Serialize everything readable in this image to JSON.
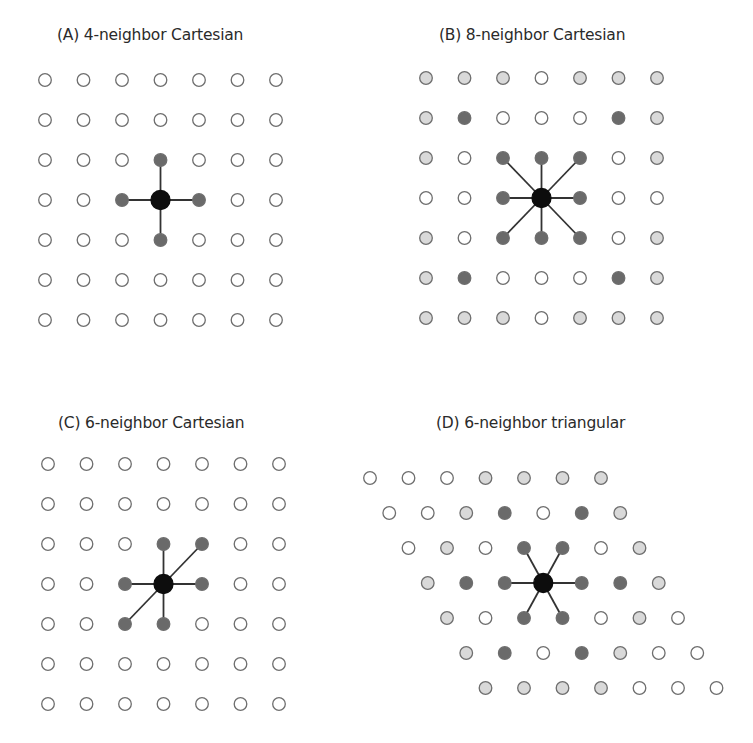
{
  "colors": {
    "empty_fill": "#ffffff",
    "light_fill": "#d9d9d9",
    "dark_fill": "#6a6a6a",
    "center_fill": "#0d0d0d",
    "stroke": "#6e6e6e",
    "edge": "#333333",
    "title_text": "#2a2a2a"
  },
  "panels": [
    {
      "id": "A",
      "title": "(A) 4-neighbor Cartesian",
      "title_pos": [
        57,
        26
      ],
      "origin": [
        45,
        80
      ],
      "dx": 38.5,
      "dy": 40,
      "row_shift": 0,
      "grid": [
        "0000000",
        "0000000",
        "000D000",
        "00DCD00",
        "000D000",
        "0000000",
        "0000000"
      ],
      "center": [
        3,
        3
      ],
      "edges": [
        [
          2,
          3
        ],
        [
          3,
          2
        ],
        [
          3,
          4
        ],
        [
          4,
          3
        ]
      ]
    },
    {
      "id": "B",
      "title": "(B) 8-neighbor Cartesian",
      "title_pos": [
        439,
        26
      ],
      "origin": [
        426,
        78
      ],
      "dx": 38.5,
      "dy": 40,
      "row_shift": 0,
      "grid": [
        "LLL0LLL",
        "LD000DL",
        "L0DDD0L",
        "00DCD00",
        "L0DDD0L",
        "LD000DL",
        "LLL0LLL"
      ],
      "center": [
        3,
        3
      ],
      "edges": [
        [
          2,
          2
        ],
        [
          2,
          3
        ],
        [
          2,
          4
        ],
        [
          3,
          2
        ],
        [
          3,
          4
        ],
        [
          4,
          2
        ],
        [
          4,
          3
        ],
        [
          4,
          4
        ]
      ]
    },
    {
      "id": "C",
      "title": "(C) 6-neighbor Cartesian",
      "title_pos": [
        58,
        414
      ],
      "origin": [
        48,
        464
      ],
      "dx": 38.5,
      "dy": 40,
      "row_shift": 0,
      "grid": [
        "0000000",
        "0000000",
        "000DD00",
        "00DCD00",
        "00DD000",
        "0000000",
        "0000000"
      ],
      "center": [
        3,
        3
      ],
      "edges": [
        [
          2,
          3
        ],
        [
          2,
          4
        ],
        [
          3,
          2
        ],
        [
          3,
          4
        ],
        [
          4,
          2
        ],
        [
          4,
          3
        ]
      ]
    },
    {
      "id": "D",
      "title": "(D) 6-neighbor triangular",
      "title_pos": [
        436,
        414
      ],
      "origin": [
        370,
        478
      ],
      "dx": 38.5,
      "dy": 35,
      "row_shift": 19.25,
      "grid": [
        "000LLLL",
        "00LD0DL",
        "0L0DD0L",
        "LDDCDDL",
        "L0DD0L0",
        "LD0DL00",
        "LLLL000"
      ],
      "center": [
        3,
        3
      ],
      "edges": [
        [
          2,
          3
        ],
        [
          2,
          4
        ],
        [
          3,
          2
        ],
        [
          3,
          4
        ],
        [
          4,
          2
        ],
        [
          4,
          3
        ]
      ]
    }
  ]
}
